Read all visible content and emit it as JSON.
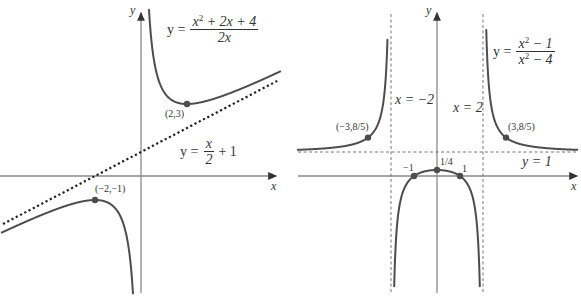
{
  "left_graph": {
    "title_equation": {
      "lhs": "y =",
      "numerator": "x² + 2x + 4",
      "denominator": "2x"
    },
    "asymptote_equation": {
      "lhs": "y =",
      "numerator": "x",
      "denominator": "2",
      "tail": "+ 1"
    },
    "axis_labels": {
      "x": "x",
      "y": "y"
    },
    "points": [
      {
        "label": "(2,3)",
        "x": 2,
        "y": 3
      },
      {
        "label": "(−2,−1)",
        "x": -2,
        "y": -1
      }
    ]
  },
  "right_graph": {
    "title_equation": {
      "lhs": "y =",
      "numerator": "x² − 1",
      "denominator": "x² − 4"
    },
    "vertical_asymptotes": [
      {
        "label": "x = −2",
        "x": -2
      },
      {
        "label": "x = 2",
        "x": 2
      }
    ],
    "horizontal_asymptote": {
      "label": "y = 1",
      "y": 1
    },
    "axis_labels": {
      "x": "x",
      "y": "y"
    },
    "points": [
      {
        "label": "(−3,8/5)",
        "x": -3,
        "y": 1.6
      },
      {
        "label": "(3,8/5)",
        "x": 3,
        "y": 1.6
      },
      {
        "label": "−1",
        "x": -1,
        "y": 0
      },
      {
        "label": "1/4",
        "x": 0,
        "y": 0.25
      },
      {
        "label": "1",
        "x": 1,
        "y": 0
      }
    ]
  },
  "colors": {
    "curve": "#4d4d4d",
    "axis": "#8a8a8a",
    "asymptote": "#222222"
  }
}
